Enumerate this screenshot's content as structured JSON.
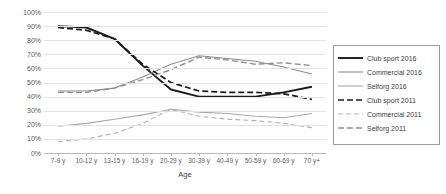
{
  "chart_data": {
    "type": "line",
    "title": "",
    "xlabel": "Age",
    "ylabel": "",
    "categories": [
      "7-9 y",
      "10-12 y",
      "13-15 y",
      "16-19 y",
      "20-29 y",
      "30-39 y",
      "40-49 y",
      "50-59 y",
      "60-69 y",
      "70 y+"
    ],
    "ylim": [
      0,
      100
    ],
    "ytick_labels": [
      "100%",
      "90%",
      "80%",
      "70%",
      "60%",
      "50%",
      "40%",
      "30%",
      "20%",
      "10%",
      "0%"
    ],
    "ytick_values": [
      100,
      90,
      80,
      70,
      60,
      50,
      40,
      30,
      20,
      10,
      0
    ],
    "grid": true,
    "legend_position": "right",
    "series": [
      {
        "name": "Club sport 2016",
        "color": "#1a1a1a",
        "width": 1.9,
        "dash": "none",
        "values": [
          90,
          89,
          81,
          62,
          45,
          40,
          40,
          40,
          43,
          47
        ]
      },
      {
        "name": "Commercial 2016",
        "color": "#8c8c8c",
        "width": 1.1,
        "dash": "none",
        "values": [
          44,
          44,
          46,
          54,
          63,
          69,
          67,
          65,
          61,
          56
        ]
      },
      {
        "name": "Selforg 2016",
        "color": "#a8a8a8",
        "width": 1.1,
        "dash": "none",
        "values": [
          19,
          21,
          24,
          27,
          31,
          29,
          28,
          26,
          25,
          28
        ]
      },
      {
        "name": "Club sport 2011",
        "color": "#1a1a1a",
        "width": 1.7,
        "dash": "6,3",
        "values": [
          89,
          87,
          81,
          63,
          50,
          44,
          43,
          43,
          42,
          38
        ]
      },
      {
        "name": "Commercial 2011",
        "color": "#b0b0b0",
        "width": 1.1,
        "dash": "5,3",
        "values": [
          8,
          10,
          14,
          21,
          31,
          26,
          24,
          23,
          21,
          18
        ]
      },
      {
        "name": "Selforg 2011",
        "color": "#8f8f8f",
        "width": 1.4,
        "dash": "6,3",
        "values": [
          43,
          43,
          46,
          52,
          59,
          68,
          66,
          63,
          64,
          62
        ]
      }
    ]
  },
  "legend": {
    "items": [
      {
        "label": "Club sport 2016"
      },
      {
        "label": "Commercial 2016"
      },
      {
        "label": "Selforg 2016"
      },
      {
        "label": "Club sport 2011"
      },
      {
        "label": "Commercial 2011"
      },
      {
        "label": "Selforg 2011"
      }
    ]
  }
}
